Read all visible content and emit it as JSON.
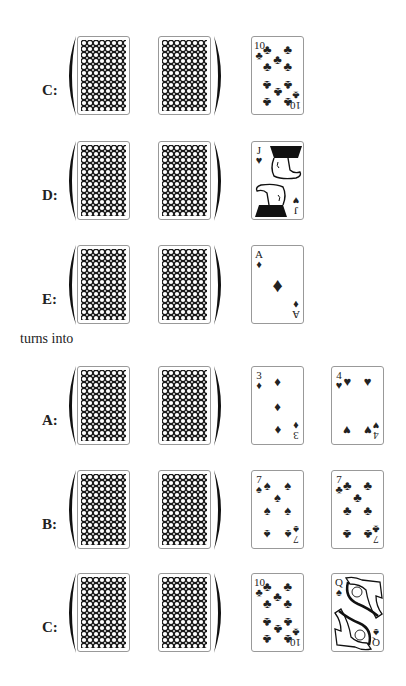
{
  "connector_text": "turns into",
  "before": [
    {
      "label": "C:",
      "top": 36,
      "faces": [
        {
          "rank": "10",
          "suit": "clubs"
        }
      ]
    },
    {
      "label": "D:",
      "top": 141,
      "faces": [
        {
          "rank": "J",
          "suit": "hearts"
        }
      ]
    },
    {
      "label": "E:",
      "top": 245,
      "faces": [
        {
          "rank": "A",
          "suit": "diamonds"
        }
      ]
    }
  ],
  "after": [
    {
      "label": "A:",
      "top": 366,
      "faces": [
        {
          "rank": "3",
          "suit": "diamonds"
        },
        {
          "rank": "4",
          "suit": "hearts"
        }
      ]
    },
    {
      "label": "B:",
      "top": 470,
      "faces": [
        {
          "rank": "7",
          "suit": "spades"
        },
        {
          "rank": "7",
          "suit": "clubs"
        }
      ]
    },
    {
      "label": "C:",
      "top": 573,
      "faces": [
        {
          "rank": "10",
          "suit": "clubs"
        },
        {
          "rank": "Q",
          "suit": "spades"
        }
      ]
    }
  ],
  "hand": {
    "face_down_count": 2,
    "bracket": "parentheses"
  },
  "glyphs": {
    "clubs": "♣",
    "spades": "♠",
    "hearts": "♥",
    "diamonds": "♦"
  }
}
